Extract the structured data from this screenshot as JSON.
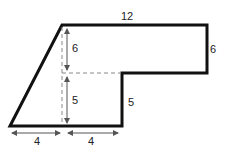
{
  "diagram": {
    "type": "composite-shape-dimensions",
    "shape": "trapezoid-with-notch",
    "colors": {
      "outline": "#111111",
      "dashed": "#888888",
      "arrow": "#555555",
      "text": "#222222",
      "background": "#ffffff"
    },
    "labels": {
      "top": "12",
      "right": "6",
      "inner_upper_height": "6",
      "inner_lower_height": "5",
      "notch_height": "5",
      "bottom_left": "4",
      "bottom_right": "4"
    }
  }
}
